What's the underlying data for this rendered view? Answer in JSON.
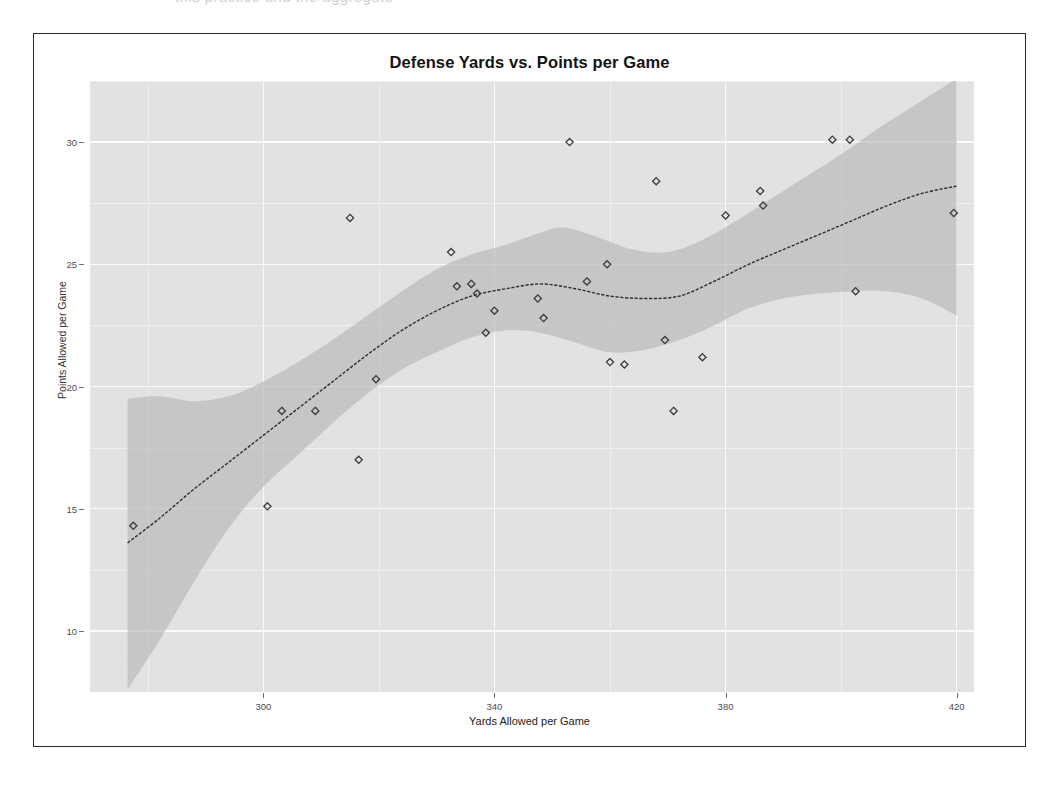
{
  "page": {
    "top_cut_text": "this practice and the aggregate"
  },
  "chart_data": {
    "type": "scatter",
    "title": "Defense Yards vs. Points per Game",
    "xlabel": "Yards Allowed per Game",
    "ylabel": "Points Allowed per Game",
    "xlim": [
      270,
      423
    ],
    "ylim": [
      7.5,
      32.5
    ],
    "xticks": [
      300,
      340,
      380,
      420
    ],
    "yticks": [
      10,
      15,
      20,
      25,
      30
    ],
    "xtick_labels": [
      "300",
      "340",
      "420",
      "420"
    ],
    "x_tick_labels": [
      "300",
      "340",
      "380",
      "420"
    ],
    "y_tick_labels": [
      "10",
      "15",
      "20",
      "25",
      "30"
    ],
    "grid": true,
    "legend": "none",
    "panel_background": "#e2e2e2",
    "grid_color": "#fafafa",
    "point_color": "#3a3a3a",
    "point_shape": "diamond",
    "line_color": "#2e2e2e",
    "ribbon_color": "#b4b4b4",
    "series": [
      {
        "name": "Teams",
        "points": [
          {
            "x": 277.5,
            "y": 14.3
          },
          {
            "x": 300.7,
            "y": 15.1
          },
          {
            "x": 303.2,
            "y": 19.0
          },
          {
            "x": 309.0,
            "y": 19.0
          },
          {
            "x": 315.0,
            "y": 26.9
          },
          {
            "x": 316.5,
            "y": 17.0
          },
          {
            "x": 319.5,
            "y": 20.3
          },
          {
            "x": 332.5,
            "y": 25.5
          },
          {
            "x": 333.5,
            "y": 24.1
          },
          {
            "x": 336.0,
            "y": 24.2
          },
          {
            "x": 337.0,
            "y": 23.8
          },
          {
            "x": 338.5,
            "y": 22.2
          },
          {
            "x": 340.0,
            "y": 23.1
          },
          {
            "x": 347.5,
            "y": 23.6
          },
          {
            "x": 348.5,
            "y": 22.8
          },
          {
            "x": 353.0,
            "y": 30.0
          },
          {
            "x": 356.0,
            "y": 24.3
          },
          {
            "x": 359.5,
            "y": 25.0
          },
          {
            "x": 360.0,
            "y": 21.0
          },
          {
            "x": 362.5,
            "y": 20.9
          },
          {
            "x": 368.0,
            "y": 28.4
          },
          {
            "x": 369.5,
            "y": 21.9
          },
          {
            "x": 371.0,
            "y": 19.0
          },
          {
            "x": 376.0,
            "y": 21.2
          },
          {
            "x": 380.0,
            "y": 27.0
          },
          {
            "x": 386.0,
            "y": 28.0
          },
          {
            "x": 386.5,
            "y": 27.4
          },
          {
            "x": 398.5,
            "y": 30.1
          },
          {
            "x": 401.5,
            "y": 30.1
          },
          {
            "x": 402.5,
            "y": 23.9
          },
          {
            "x": 419.5,
            "y": 27.1
          }
        ]
      }
    ],
    "smooth": {
      "method": "loess",
      "line": [
        {
          "x": 276.5,
          "y": 13.6
        },
        {
          "x": 282.0,
          "y": 14.6
        },
        {
          "x": 288.0,
          "y": 15.8
        },
        {
          "x": 294.0,
          "y": 16.9
        },
        {
          "x": 300.0,
          "y": 18.0
        },
        {
          "x": 306.0,
          "y": 19.1
        },
        {
          "x": 312.0,
          "y": 20.2
        },
        {
          "x": 318.0,
          "y": 21.3
        },
        {
          "x": 324.0,
          "y": 22.3
        },
        {
          "x": 330.0,
          "y": 23.1
        },
        {
          "x": 336.0,
          "y": 23.7
        },
        {
          "x": 342.0,
          "y": 24.0
        },
        {
          "x": 348.0,
          "y": 24.2
        },
        {
          "x": 354.0,
          "y": 24.0
        },
        {
          "x": 360.0,
          "y": 23.7
        },
        {
          "x": 366.0,
          "y": 23.6
        },
        {
          "x": 372.0,
          "y": 23.7
        },
        {
          "x": 378.0,
          "y": 24.3
        },
        {
          "x": 384.0,
          "y": 25.0
        },
        {
          "x": 390.0,
          "y": 25.6
        },
        {
          "x": 396.0,
          "y": 26.2
        },
        {
          "x": 402.0,
          "y": 26.8
        },
        {
          "x": 408.0,
          "y": 27.4
        },
        {
          "x": 414.0,
          "y": 27.9
        },
        {
          "x": 420.0,
          "y": 28.2
        }
      ],
      "upper": [
        {
          "x": 276.5,
          "y": 19.5
        },
        {
          "x": 282.0,
          "y": 19.6
        },
        {
          "x": 288.0,
          "y": 19.4
        },
        {
          "x": 294.0,
          "y": 19.6
        },
        {
          "x": 300.0,
          "y": 20.2
        },
        {
          "x": 306.0,
          "y": 21.0
        },
        {
          "x": 312.0,
          "y": 21.9
        },
        {
          "x": 318.0,
          "y": 22.9
        },
        {
          "x": 324.0,
          "y": 23.9
        },
        {
          "x": 330.0,
          "y": 24.8
        },
        {
          "x": 336.0,
          "y": 25.4
        },
        {
          "x": 342.0,
          "y": 25.8
        },
        {
          "x": 348.0,
          "y": 26.3
        },
        {
          "x": 352.0,
          "y": 26.5
        },
        {
          "x": 358.0,
          "y": 26.1
        },
        {
          "x": 364.0,
          "y": 25.6
        },
        {
          "x": 370.0,
          "y": 25.5
        },
        {
          "x": 376.0,
          "y": 26.0
        },
        {
          "x": 382.0,
          "y": 26.8
        },
        {
          "x": 388.0,
          "y": 27.7
        },
        {
          "x": 394.0,
          "y": 28.6
        },
        {
          "x": 400.0,
          "y": 29.5
        },
        {
          "x": 406.0,
          "y": 30.5
        },
        {
          "x": 412.0,
          "y": 31.4
        },
        {
          "x": 418.0,
          "y": 32.3
        },
        {
          "x": 420.0,
          "y": 32.6
        }
      ],
      "lower": [
        {
          "x": 276.5,
          "y": 7.6
        },
        {
          "x": 282.0,
          "y": 9.6
        },
        {
          "x": 288.0,
          "y": 12.0
        },
        {
          "x": 294.0,
          "y": 14.2
        },
        {
          "x": 300.0,
          "y": 15.9
        },
        {
          "x": 306.0,
          "y": 17.2
        },
        {
          "x": 312.0,
          "y": 18.5
        },
        {
          "x": 318.0,
          "y": 19.7
        },
        {
          "x": 324.0,
          "y": 20.7
        },
        {
          "x": 330.0,
          "y": 21.4
        },
        {
          "x": 336.0,
          "y": 22.0
        },
        {
          "x": 342.0,
          "y": 22.3
        },
        {
          "x": 348.0,
          "y": 22.2
        },
        {
          "x": 354.0,
          "y": 21.8
        },
        {
          "x": 360.0,
          "y": 21.4
        },
        {
          "x": 366.0,
          "y": 21.5
        },
        {
          "x": 372.0,
          "y": 21.9
        },
        {
          "x": 378.0,
          "y": 22.5
        },
        {
          "x": 384.0,
          "y": 23.2
        },
        {
          "x": 390.0,
          "y": 23.6
        },
        {
          "x": 396.0,
          "y": 23.8
        },
        {
          "x": 402.0,
          "y": 23.9
        },
        {
          "x": 408.0,
          "y": 23.9
        },
        {
          "x": 414.0,
          "y": 23.6
        },
        {
          "x": 420.0,
          "y": 22.9
        }
      ]
    }
  }
}
